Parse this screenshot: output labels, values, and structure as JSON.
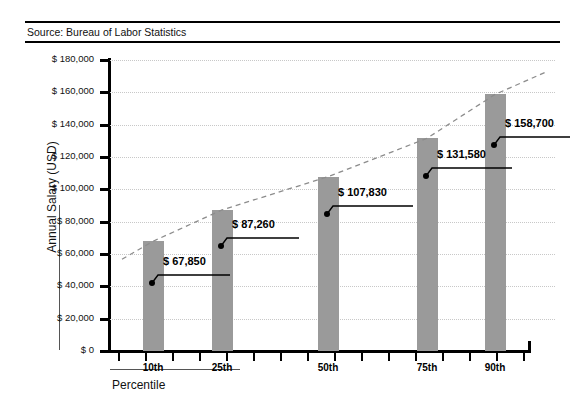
{
  "header": {
    "source": "Source: Bureau of Labor Statistics"
  },
  "chart_data": {
    "type": "bar",
    "title": "",
    "subtitle": "",
    "xlabel": "Percentile",
    "ylabel": "Annual Salary (USD)",
    "categories": [
      "10th",
      "25th",
      "50th",
      "75th",
      "90th"
    ],
    "values": [
      67850,
      87260,
      107830,
      131580,
      158700
    ],
    "value_labels": [
      "$ 67,850",
      "$ 87,260",
      "$ 107,830",
      "$ 131,580",
      "$ 158,700"
    ],
    "ylim": [
      0,
      180000
    ],
    "ytick_values": [
      0,
      20000,
      40000,
      60000,
      80000,
      100000,
      120000,
      140000,
      160000,
      180000
    ],
    "ytick_labels": [
      "$ 0",
      "$ 20,000",
      "$ 40,000",
      "$ 60,000",
      "$ 80,000",
      "$ 100,000",
      "$ 120,000",
      "$ 140,000",
      "$ 160,000",
      "$ 180,000"
    ],
    "grid": "horizontal-dotted",
    "legend": "none",
    "series": [
      {
        "name": "Annual Salary",
        "values": [
          67850,
          87260,
          107830,
          131580,
          158700
        ],
        "color": "#9a9a9a"
      },
      {
        "name": "Trend",
        "type": "line",
        "style": "dashed",
        "color": "#8c8c8c",
        "values": [
          67850,
          87260,
          107830,
          131580,
          158700
        ]
      }
    ],
    "colors": {
      "bar": "#9a9a9a",
      "trend": "#8c8c8c",
      "grid": "#c8c8c8",
      "axis": "#000000",
      "text": "#111111"
    }
  }
}
